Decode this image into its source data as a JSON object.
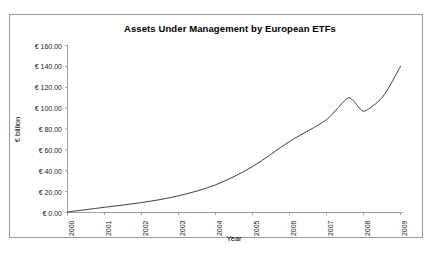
{
  "chart_data": {
    "type": "line",
    "title": "Assets Under Management by European ETFs",
    "xlabel": "Year",
    "ylabel": "€ billion",
    "categories": [
      "2000",
      "2001",
      "2002",
      "2003",
      "2004",
      "2005",
      "2006",
      "2007",
      "2008",
      "2009"
    ],
    "xtick_labels": [
      "2000",
      "2001",
      "2002",
      "2003",
      "2004",
      "2005",
      "2006",
      "2007",
      "2008",
      "2009"
    ],
    "ytick_labels": [
      "€ 0.00",
      "€ 20.00",
      "€ 40.00",
      "€ 60.00",
      "€ 80.00",
      "€ 100.00",
      "€ 120.00",
      "€ 140.00",
      "€ 160.00"
    ],
    "ytick_values": [
      0,
      20,
      40,
      60,
      80,
      100,
      120,
      140,
      160
    ],
    "ylim": [
      0,
      160
    ],
    "xlim": [
      2000,
      2009
    ],
    "grid": false,
    "legend": false,
    "series": [
      {
        "name": "Assets Under Management",
        "line_color": "#404040",
        "x": [
          2000,
          2001,
          2002,
          2003,
          2004,
          2005,
          2006,
          2007,
          2007.6,
          2008.0,
          2008.5,
          2009
        ],
        "values": [
          0.5,
          5.0,
          9.5,
          16.0,
          26.5,
          44.0,
          68.0,
          89.0,
          110.0,
          97.0,
          110.0,
          140.0
        ]
      }
    ]
  },
  "figure": {
    "background_color": "#ffffff",
    "border_color": "#9a9a9a",
    "axis_color": "#a0a0a0",
    "text_color": "#1a1a1a"
  }
}
